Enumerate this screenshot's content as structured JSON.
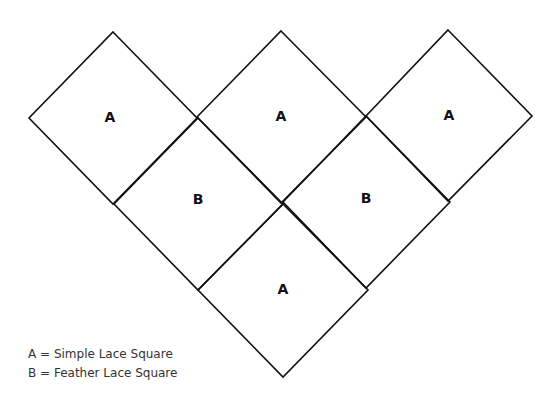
{
  "diagram": {
    "title": "",
    "stroke_color": "#111111",
    "background": "#ffffff",
    "squares": [
      {
        "label": "A",
        "cx": 113,
        "cy": 118,
        "points": "113,32 197,118 113,204 29,118"
      },
      {
        "label": "A",
        "cx": 281,
        "cy": 117,
        "points": "281,31 366,117 281,203 197,117"
      },
      {
        "label": "A",
        "cx": 448,
        "cy": 116,
        "points": "448,30 532,116 448,201 366,116"
      },
      {
        "label": "B",
        "cx": 198,
        "cy": 204,
        "points": "198,118 283,204 198,290 114,204"
      },
      {
        "label": "B",
        "cx": 366,
        "cy": 202,
        "points": "366,116 450,202 366,288 283,202"
      },
      {
        "label": "A",
        "cx": 283,
        "cy": 290,
        "points": "283,204 368,290 283,377 198,290"
      }
    ]
  },
  "legend": {
    "items": [
      {
        "text": "A = Simple Lace Square"
      },
      {
        "text": "B = Feather Lace Square"
      }
    ]
  }
}
